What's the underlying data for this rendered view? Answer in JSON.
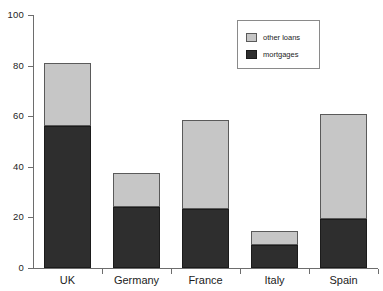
{
  "chart_data": {
    "type": "bar",
    "subtype": "stacked-bar",
    "title": "",
    "subtitle": "",
    "xlabel": "",
    "ylabel": "",
    "ylim": [
      0,
      100
    ],
    "yticks": [
      0,
      20,
      40,
      60,
      80,
      100
    ],
    "ytick_labels": [
      "0",
      "20",
      "40",
      "60",
      "80",
      "100"
    ],
    "grid": false,
    "legend_position": "top-right",
    "categories": [
      "UK",
      "Germany",
      "France",
      "Italy",
      "Spain"
    ],
    "series": [
      {
        "name": "mortgages",
        "color": "#2e2e2e",
        "values": [
          56,
          24,
          23.5,
          9,
          19.5
        ]
      },
      {
        "name": "other loans",
        "color": "#c6c6c6",
        "values": [
          25,
          13.5,
          35,
          5.5,
          41.5
        ]
      }
    ],
    "totals": [
      81,
      37.5,
      58.5,
      14.5,
      61
    ],
    "stack_order": [
      "mortgages",
      "other loans"
    ],
    "legend_entries": [
      {
        "label": "other loans",
        "color": "#c6c6c6"
      },
      {
        "label": "mortgages",
        "color": "#2e2e2e"
      }
    ]
  },
  "axes": {
    "y_ticks": [
      {
        "label": "100",
        "value": 100
      },
      {
        "label": "80",
        "value": 80
      },
      {
        "label": "60",
        "value": 60
      },
      {
        "label": "40",
        "value": 40
      },
      {
        "label": "20",
        "value": 20
      },
      {
        "label": "0",
        "value": 0
      }
    ],
    "x_categories": [
      "UK",
      "Germany",
      "France",
      "Italy",
      "Spain"
    ]
  },
  "colors": {
    "other_loans": "#c6c6c6",
    "mortgages": "#2e2e2e",
    "axis": "#6d6d6d",
    "background": "#ffffff",
    "text": "#1c1c1c"
  }
}
